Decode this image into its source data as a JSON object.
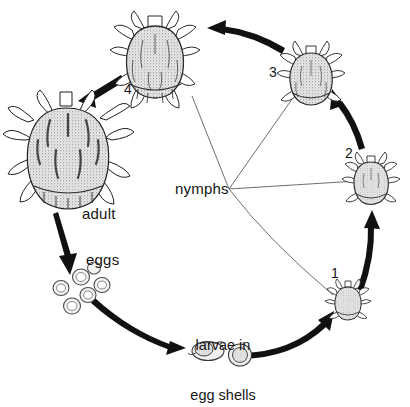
{
  "figure": {
    "type": "life-cycle-diagram",
    "background_color": "#ffffff",
    "ink_color": "#1a1a1a",
    "thin_line_color": "#5a5a5a"
  },
  "labels": {
    "adult": "adult",
    "eggs": "eggs",
    "larvae_line1": "larvae in",
    "larvae_line2": "egg shells",
    "nymphs": "nymphs",
    "nymph_1": "1",
    "nymph_2": "2",
    "nymph_3": "3",
    "nymph_4": "4"
  },
  "stages": [
    {
      "id": "adult",
      "label": "adult",
      "kind": "tick-adult",
      "x": 68,
      "y": 155,
      "size": "largest"
    },
    {
      "id": "eggs",
      "label": "eggs",
      "kind": "egg-cluster",
      "x": 86,
      "y": 290,
      "count": 6
    },
    {
      "id": "larvae",
      "label": "larvae in egg shells",
      "kind": "larva-in-shell",
      "x": 218,
      "y": 350,
      "count": 2
    },
    {
      "id": "nymph1",
      "label": "1",
      "kind": "tick-nymph",
      "x": 348,
      "y": 300,
      "size": "smallest"
    },
    {
      "id": "nymph2",
      "label": "2",
      "kind": "tick-nymph",
      "x": 371,
      "y": 180,
      "size": "small"
    },
    {
      "id": "nymph3",
      "label": "3",
      "kind": "tick-nymph",
      "x": 311,
      "y": 75,
      "size": "medium"
    },
    {
      "id": "nymph4",
      "label": "4",
      "kind": "tick-nymph",
      "x": 155,
      "y": 52,
      "size": "large"
    }
  ],
  "arrows": [
    {
      "from": "adult",
      "to": "eggs",
      "style": "thick-tapered"
    },
    {
      "from": "eggs",
      "to": "larvae",
      "style": "thick-tapered"
    },
    {
      "from": "larvae",
      "to": "nymph1",
      "style": "thick-tapered"
    },
    {
      "from": "nymph1",
      "to": "nymph2",
      "style": "thick-tapered"
    },
    {
      "from": "nymph2",
      "to": "nymph3",
      "style": "thick-tapered"
    },
    {
      "from": "nymph3",
      "to": "nymph4",
      "style": "thick-tapered"
    },
    {
      "from": "nymph4",
      "to": "adult",
      "style": "thick-tapered"
    }
  ],
  "leader_lines": [
    {
      "from": "nymphs",
      "to": "nymph1"
    },
    {
      "from": "nymphs",
      "to": "nymph2"
    },
    {
      "from": "nymphs",
      "to": "nymph3"
    },
    {
      "from": "nymphs",
      "to": "nymph4"
    }
  ]
}
